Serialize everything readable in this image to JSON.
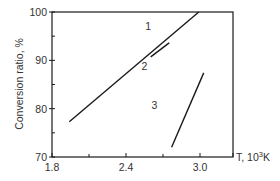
{
  "chart_data": {
    "type": "line",
    "title": "",
    "xlabel": "T, 10³K",
    "ylabel": "Conversion ratio, %",
    "xlim": [
      1.8,
      3.27
    ],
    "ylim": [
      70,
      100
    ],
    "x_ticks": [
      1.8,
      2.4,
      3.0
    ],
    "x_tick_labels": [
      "1.8",
      "2.4",
      "3.0"
    ],
    "x_minor_ticks": [
      2.1,
      2.7
    ],
    "y_ticks": [
      70,
      80,
      90,
      100
    ],
    "y_tick_labels": [
      "70",
      "80",
      "90",
      "100"
    ],
    "y_minor_ticks": [
      75,
      85,
      95
    ],
    "grid": false,
    "legend": "none (curves labeled inline)",
    "series": [
      {
        "name": "1",
        "label_pos": [
          2.58,
          96.2
        ],
        "x": [
          2.6,
          2.75
        ],
        "y": [
          90.7,
          93.6
        ]
      },
      {
        "name": "2",
        "label_pos": [
          2.55,
          88.0
        ],
        "x": [
          1.94,
          2.99
        ],
        "y": [
          77.3,
          100.0
        ]
      },
      {
        "name": "3",
        "label_pos": [
          2.63,
          80.0
        ],
        "x": [
          2.77,
          3.03
        ],
        "y": [
          72.0,
          87.4
        ]
      }
    ],
    "colors": {
      "line": "#1a1a1a",
      "axis": "#1a1a1a",
      "text": "#333333"
    }
  }
}
